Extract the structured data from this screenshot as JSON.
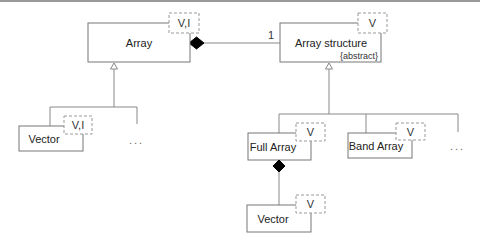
{
  "diagram": {
    "type": "UML class diagram",
    "classes": {
      "array": {
        "name": "Array",
        "template_params": "V,I"
      },
      "array_structure": {
        "name": "Array structure",
        "stereotype": "{abstract}",
        "template_params": "V"
      },
      "vector_left": {
        "name": "Vector",
        "template_params": "V,I"
      },
      "full_array": {
        "name": "Full Array",
        "template_params": "V"
      },
      "band_array": {
        "name": "Band Array",
        "template_params": "V"
      },
      "vector_bottom": {
        "name": "Vector",
        "template_params": "V"
      }
    },
    "relations": [
      {
        "type": "composition",
        "from": "Array",
        "to": "Array structure",
        "multiplicity": "1"
      },
      {
        "type": "generalization",
        "parent": "Array",
        "children": [
          "Vector",
          "..."
        ]
      },
      {
        "type": "generalization",
        "parent": "Array structure",
        "children": [
          "Full Array",
          "Band Array",
          "..."
        ]
      },
      {
        "type": "composition",
        "from": "Full Array",
        "to": "Vector"
      }
    ],
    "multiplicity_label": "1",
    "ellipsis": "..."
  }
}
